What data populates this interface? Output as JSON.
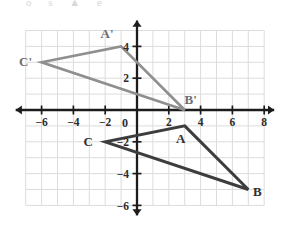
{
  "chart_data": {
    "type": "scatter",
    "title": "",
    "xlabel": "",
    "ylabel": "",
    "xlim": [
      -7,
      8
    ],
    "ylim": [
      -6,
      5
    ],
    "grid": true,
    "grid_step": 1,
    "legend": "none",
    "origin_label": "0",
    "x_ticks": [
      -6,
      -4,
      -2,
      2,
      4,
      6,
      8
    ],
    "x_tick_labels": [
      "−6",
      "−4",
      "−2",
      "2",
      "4",
      "6",
      "8"
    ],
    "y_ticks": [
      4,
      2,
      -2,
      -4,
      -6
    ],
    "y_tick_labels": [
      "4",
      "2",
      "−2",
      "−4",
      "−6"
    ],
    "series": [
      {
        "name": "Triangle ABC",
        "type": "polygon",
        "color": "#3d3d3d",
        "closed": true,
        "points": [
          {
            "label": "A",
            "x": 3,
            "y": -1
          },
          {
            "label": "B",
            "x": 7,
            "y": -5
          },
          {
            "label": "C",
            "x": -2,
            "y": -2
          }
        ]
      },
      {
        "name": "Triangle A'B'C'",
        "type": "polygon",
        "color": "#8f8f8f",
        "closed": true,
        "points": [
          {
            "label": "A'",
            "x": -1,
            "y": 4
          },
          {
            "label": "B'",
            "x": 3,
            "y": 0
          },
          {
            "label": "C'",
            "x": -6,
            "y": 3
          }
        ]
      }
    ],
    "annotations": [
      {
        "text": "A'",
        "x": -1,
        "y": 4,
        "dx": -14,
        "dy": -8,
        "style": "image"
      },
      {
        "text": "B'",
        "x": 3,
        "y": 0,
        "dx": 6,
        "dy": -6,
        "style": "image"
      },
      {
        "text": "C'",
        "x": -6,
        "y": 3,
        "dx": -16,
        "dy": 4,
        "style": "image"
      },
      {
        "text": "A",
        "x": 3,
        "y": -1,
        "dx": -4,
        "dy": 17,
        "style": "preimage"
      },
      {
        "text": "B",
        "x": 7,
        "y": -5,
        "dx": 9,
        "dy": 6,
        "style": "preimage"
      },
      {
        "text": "C",
        "x": -2,
        "y": -2,
        "dx": -17,
        "dy": 4,
        "style": "preimage"
      }
    ]
  },
  "colors": {
    "grid": "#dcdcdc",
    "axis": "#1c1c1c",
    "preimage": "#3d3d3d",
    "image": "#8f8f8f",
    "background": "#ffffff",
    "tick_text": "#2b2b2b"
  },
  "watermark": {
    "text": "o  s  ▲  e"
  }
}
